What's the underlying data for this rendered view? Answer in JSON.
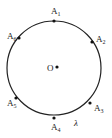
{
  "diagram": {
    "type": "circle-with-points",
    "circle": {
      "cx": 54,
      "cy": 68,
      "r": 47,
      "stroke": "#222222"
    },
    "center": {
      "label": "O",
      "x": 54,
      "y": 68
    },
    "points": [
      {
        "label": "A",
        "sub": "1",
        "x": 54,
        "y": 21,
        "lx": 51,
        "ly": 14
      },
      {
        "label": "A",
        "sub": "2",
        "x": 92,
        "y": 42,
        "lx": 96,
        "ly": 42
      },
      {
        "label": "A",
        "sub": "3",
        "x": 90,
        "y": 103,
        "lx": 94,
        "ly": 111
      },
      {
        "label": "A",
        "sub": "4",
        "x": 54,
        "y": 118,
        "lx": 51,
        "ly": 130
      },
      {
        "label": "A",
        "sub": "5",
        "x": 16,
        "y": 98,
        "lx": 7,
        "ly": 106
      },
      {
        "label": "A",
        "sub": "6",
        "x": 19,
        "y": 38,
        "lx": 7,
        "ly": 39
      }
    ],
    "arc_label": {
      "text": "λ",
      "x": 74,
      "y": 126
    }
  }
}
